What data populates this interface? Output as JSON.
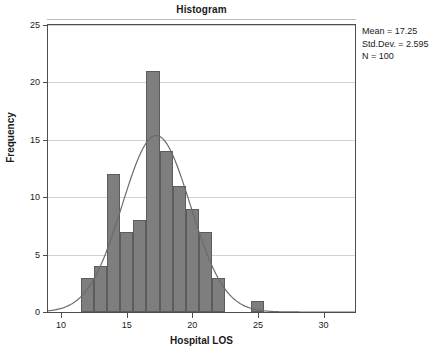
{
  "chart_data": {
    "type": "bar",
    "title": "Histogram",
    "xlabel": "Hospital LOS",
    "ylabel": "Frequency",
    "xlim": [
      9,
      32.4
    ],
    "ylim": [
      0,
      25
    ],
    "grid": true,
    "bin_width": 1,
    "bin_starts": [
      11.5,
      12.5,
      13.5,
      14.5,
      15.5,
      16.5,
      17.5,
      18.5,
      19.5,
      20.5,
      21.5,
      24.5
    ],
    "bin_centers": [
      12,
      13,
      14,
      15,
      16,
      17,
      18,
      19,
      20,
      21,
      22,
      25
    ],
    "values": [
      3,
      4,
      12,
      7,
      8,
      21,
      14,
      11,
      9,
      7,
      3,
      1
    ],
    "x_ticks": [
      10,
      15,
      20,
      25,
      30
    ],
    "x_tick_labels": [
      "10",
      "15",
      "20",
      "25",
      "30"
    ],
    "y_ticks": [
      0,
      5,
      10,
      15,
      20,
      25
    ],
    "y_tick_labels": [
      "0",
      "5",
      "10",
      "15",
      "20",
      "25"
    ],
    "bar_color": "#7e7e7e",
    "bar_border_color": "#5c5c5c",
    "curve_color": "#6b6b6b",
    "overlay": {
      "type": "normal-curve",
      "mean": 17.25,
      "std_dev": 2.595,
      "n": 100
    }
  },
  "stats": {
    "mean": "Mean = 17.25",
    "std_dev": "Std.Dev. = 2.595",
    "n": "N = 100"
  }
}
